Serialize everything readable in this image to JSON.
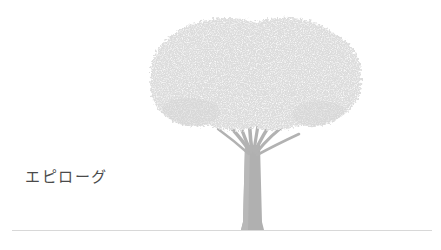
{
  "page": {
    "background_color": "#ffffff",
    "width": 441,
    "height": 250
  },
  "heading": {
    "text": "エピローグ",
    "translation_note": "Epilogue",
    "color": "#4a4a4a"
  },
  "illustration": {
    "name": "tree-illustration",
    "subject": "broad-canopy tree",
    "canopy_color": "#dcdcdc",
    "canopy_speckle_color": "#ffffff",
    "trunk_color": "#b0b0b0",
    "branch_color": "#b4b4b4",
    "canopy_bounds": {
      "left": 152,
      "right": 363,
      "top": 14,
      "bottom": 130
    },
    "trunk_bounds": {
      "left": 243,
      "right": 262,
      "top": 150,
      "bottom": 230
    },
    "branch_count": 8
  },
  "divider": {
    "name": "footer-rule",
    "color": "#d8d8d8",
    "y": 230,
    "left": 12,
    "right": 432
  }
}
